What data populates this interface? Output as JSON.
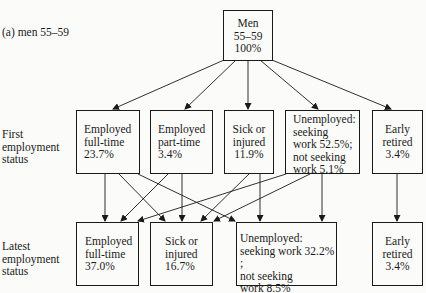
{
  "panel_label": "(a) men 55–59",
  "row_labels": {
    "first": [
      "First",
      "employment",
      "status"
    ],
    "latest": [
      "Latest",
      "employment",
      "status"
    ]
  },
  "root": {
    "lines": [
      "Men",
      "55–59",
      "100%"
    ]
  },
  "first_status": [
    {
      "id": "first-employed-full-time",
      "lines": [
        "Employed",
        "full-time",
        "23.7%"
      ]
    },
    {
      "id": "first-employed-part-time",
      "lines": [
        "Employed",
        "part-time",
        "3.4%"
      ]
    },
    {
      "id": "first-sick-or-injured",
      "lines": [
        "Sick or",
        "injured",
        "11.9%"
      ]
    },
    {
      "id": "first-unemployed",
      "lines": [
        "Unemployed:",
        "seeking",
        "work 52.5%;",
        "not seeking",
        "work 5.1%"
      ]
    },
    {
      "id": "first-early-retired",
      "lines": [
        "Early",
        "retired",
        "3.4%"
      ]
    }
  ],
  "latest_status": [
    {
      "id": "latest-employed-full-time",
      "lines": [
        "Employed",
        "full-time",
        "37.0%"
      ]
    },
    {
      "id": "latest-sick-or-injured",
      "lines": [
        "Sick or",
        "injured",
        "16.7%"
      ]
    },
    {
      "id": "latest-unemployed",
      "lines": [
        "Unemployed:",
        "seeking work 32.2% ;",
        "not seeking",
        "work 8.5%"
      ]
    },
    {
      "id": "latest-early-retired",
      "lines": [
        "Early",
        "retired",
        "3.4%"
      ]
    }
  ],
  "transitions": [
    [
      "root",
      "first-employed-full-time"
    ],
    [
      "root",
      "first-employed-part-time"
    ],
    [
      "root",
      "first-sick-or-injured"
    ],
    [
      "root",
      "first-unemployed"
    ],
    [
      "root",
      "first-early-retired"
    ],
    [
      "first-employed-full-time",
      "latest-employed-full-time"
    ],
    [
      "first-employed-full-time",
      "latest-sick-or-injured"
    ],
    [
      "first-employed-full-time",
      "latest-unemployed"
    ],
    [
      "first-employed-part-time",
      "latest-employed-full-time"
    ],
    [
      "first-employed-part-time",
      "latest-sick-or-injured"
    ],
    [
      "first-sick-or-injured",
      "latest-sick-or-injured"
    ],
    [
      "first-sick-or-injured",
      "latest-unemployed"
    ],
    [
      "first-unemployed",
      "latest-employed-full-time"
    ],
    [
      "first-unemployed",
      "latest-sick-or-injured"
    ],
    [
      "first-unemployed",
      "latest-unemployed"
    ],
    [
      "first-early-retired",
      "latest-early-retired"
    ]
  ]
}
